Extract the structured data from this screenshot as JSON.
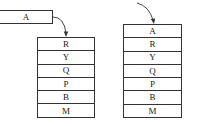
{
  "diagram": {
    "pushed_element": {
      "label": "A"
    },
    "before_stack": {
      "items": [
        "R",
        "Y",
        "Q",
        "P",
        "B",
        "M"
      ]
    },
    "after_stack": {
      "items": [
        "A",
        "R",
        "Y",
        "Q",
        "P",
        "B",
        "M"
      ]
    },
    "colors": {
      "line": "#333333",
      "background": "#ffffff",
      "text": "#222222"
    }
  }
}
